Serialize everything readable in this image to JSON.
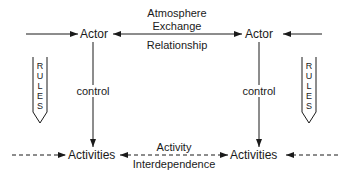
{
  "diagram": {
    "nodes": {
      "actor_left": "Actor",
      "actor_right": "Actor",
      "activities_left": "Activities",
      "activities_right": "Activities"
    },
    "edges": {
      "actor_link_top_1": "Atmosphere",
      "actor_link_top_2": "Exchange",
      "actor_link_bottom": "Relationship",
      "control_left": "control",
      "control_right": "control",
      "activity_link_top": "Activity",
      "activity_link_bottom": "Interdependence"
    },
    "rules_left": [
      "R",
      "U",
      "L",
      "E",
      "S"
    ],
    "rules_right": [
      "R",
      "U",
      "L",
      "E",
      "S"
    ],
    "colors": {
      "stroke": "#1a1a1a",
      "background": "#ffffff"
    }
  }
}
